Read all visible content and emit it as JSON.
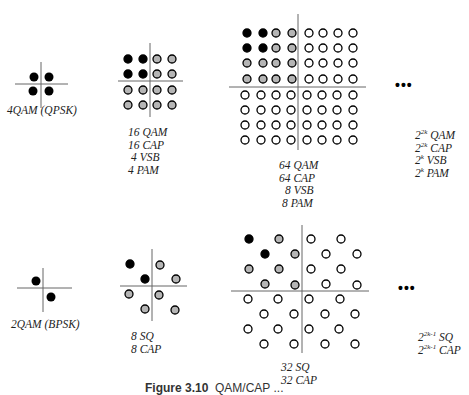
{
  "colors": {
    "filled_black": "#000000",
    "filled_gray": "#b5b5b5",
    "open": "#ffffff",
    "stroke": "#000000",
    "axis": "#555555"
  },
  "rows": [
    {
      "name": "square-qam-family",
      "constellations": [
        {
          "id": "4qam",
          "labels": [
            "4QAM (QPSK)"
          ],
          "points": 4
        },
        {
          "id": "16qam",
          "labels": [
            "16 QAM",
            "16 CAP",
            "4 VSB",
            "4 PAM"
          ],
          "points": 16
        },
        {
          "id": "64qam",
          "labels": [
            "64 QAM",
            "64 CAP",
            "8 VSB",
            "8 PAM"
          ],
          "points": 64
        },
        {
          "id": "general-2k",
          "ellipsis": "•••",
          "labels": [
            "2^2k QAM",
            "2^2k CAP",
            "2^k VSB",
            "2^k PAM"
          ]
        }
      ]
    },
    {
      "name": "cross-qam-family",
      "constellations": [
        {
          "id": "2qam",
          "labels": [
            "2QAM (BPSK)"
          ],
          "points": 2
        },
        {
          "id": "8sq",
          "labels": [
            "8 SQ",
            "8 CAP"
          ],
          "points": 8
        },
        {
          "id": "32sq",
          "labels": [
            "32 SQ",
            "32 CAP"
          ],
          "points": 32
        },
        {
          "id": "general-2k-1",
          "ellipsis": "•••",
          "labels": [
            "2^2k-1 SQ",
            "2^2k-1 CAP"
          ]
        }
      ]
    }
  ],
  "labels": {
    "qpsk": "4QAM (QPSK)",
    "qam16": [
      "16 QAM",
      "16 CAP",
      "4 VSB",
      "4 PAM"
    ],
    "qam64": [
      "64 QAM",
      "64 CAP",
      "8 VSB",
      "8 PAM"
    ],
    "gen_top": {
      "l1_base": "2",
      "l1_exp": "2k",
      "l1_text": " QAM",
      "l2_base": "2",
      "l2_exp": "2k",
      "l2_text": " CAP",
      "l3_base": "2",
      "l3_exp": "k",
      "l3_text": " VSB",
      "l4_base": "2",
      "l4_exp": "k",
      "l4_text": " PAM"
    },
    "bpsk": "2QAM (BPSK)",
    "sq8": [
      "8 SQ",
      "8 CAP"
    ],
    "sq32": [
      "32 SQ",
      "32 CAP"
    ],
    "gen_bottom": {
      "l1_base": "2",
      "l1_exp": "2k-1",
      "l1_text": " SQ",
      "l2_base": "2",
      "l2_exp": "2k-1",
      "l2_text": " CAP"
    },
    "ellipsis": "•••"
  },
  "caption": {
    "figure": "Figure 3.10",
    "text": "QAM/CAP ..."
  }
}
